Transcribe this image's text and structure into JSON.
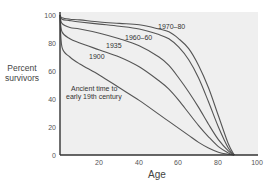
{
  "chart_data": {
    "type": "line",
    "title": "",
    "xlabel": "Age",
    "ylabel": "Percent survivors",
    "xlim": [
      0,
      100
    ],
    "ylim": [
      0,
      100
    ],
    "x_ticks": [
      20,
      40,
      60,
      80,
      100
    ],
    "y_ticks": [
      0,
      20,
      40,
      60,
      80,
      100
    ],
    "grid": false,
    "legend": "inline labels",
    "x": [
      0,
      1,
      5,
      10,
      20,
      30,
      40,
      50,
      55,
      60,
      65,
      70,
      75,
      80,
      85,
      88
    ],
    "series": [
      {
        "name": "1970–80",
        "values": [
          100,
          98,
          97,
          96.5,
          95,
          94,
          93,
          90,
          88,
          83,
          76,
          64,
          48,
          28,
          8,
          0
        ]
      },
      {
        "name": "1960–60",
        "values": [
          100,
          97,
          96,
          95,
          93.5,
          92,
          90,
          86,
          83,
          77,
          68,
          55,
          38,
          20,
          5,
          0
        ]
      },
      {
        "name": "1935",
        "values": [
          100,
          94,
          91,
          90,
          87,
          83,
          78,
          70,
          64,
          55,
          45,
          34,
          22,
          11,
          3,
          0
        ]
      },
      {
        "name": "1900",
        "values": [
          100,
          88,
          83,
          80,
          75,
          70,
          63,
          53,
          47,
          39,
          30,
          21,
          13,
          6,
          1.5,
          0
        ]
      },
      {
        "name": "Ancient time to early 19th century",
        "values": [
          100,
          77,
          70,
          65,
          57,
          48,
          39,
          29,
          24,
          19,
          14,
          9,
          5,
          2,
          0.5,
          0
        ]
      }
    ],
    "labels": {
      "y_axis_title_line1": "Percent",
      "y_axis_title_line2": "survivors",
      "x_axis_title": "Age",
      "y_tick_labels": [
        "0",
        "20",
        "40",
        "60",
        "80",
        "100"
      ],
      "x_tick_labels": [
        "20",
        "40",
        "60",
        "80",
        "100"
      ],
      "curve_1970": "1970–80",
      "curve_1960": "1960–60",
      "curve_1935": "1935",
      "curve_1900": "1900",
      "curve_ancient_line1": "Ancient time to",
      "curve_ancient_line2": "early 19th century"
    }
  },
  "colors": {
    "plot_background": "#efefef",
    "axis": "#333333",
    "curve": "#555555"
  }
}
